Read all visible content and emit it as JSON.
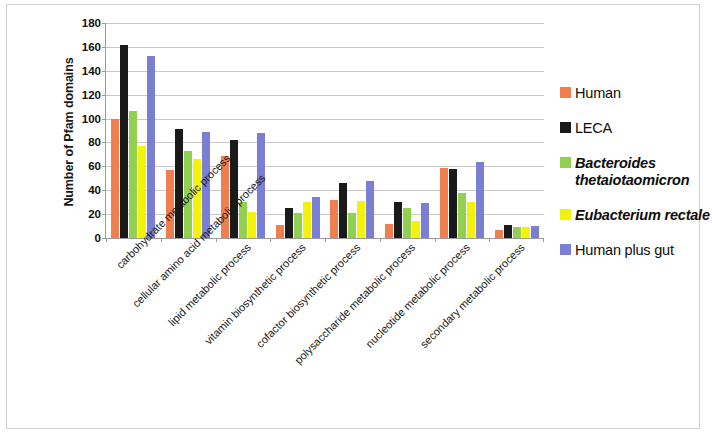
{
  "chart_data": {
    "type": "bar",
    "title": "",
    "subtitle": "",
    "xlabel": "",
    "ylabel": "Number of Pfam domains",
    "ylim": [
      0,
      180
    ],
    "ytick_step": 20,
    "yticks": [
      0,
      20,
      40,
      60,
      80,
      100,
      120,
      140,
      160,
      180
    ],
    "grid": true,
    "legend_position": "right",
    "categories": [
      "carbohydrate metabolic process",
      "cellular amino acid metabolic process",
      "lipid metabolic process",
      "vitamin biosynthetic process",
      "cofactor biosynthetic process",
      "polysaccharide metabolic process",
      "nucleotide metabolic process",
      "secondary metabolic process"
    ],
    "series": [
      {
        "name": "Human",
        "italic": false,
        "color": "#F07E4F",
        "values": [
          100,
          57,
          69,
          11,
          32,
          12,
          59,
          7
        ]
      },
      {
        "name": "LECA",
        "italic": false,
        "color": "#1A1A1A",
        "values": [
          162,
          91,
          82,
          25,
          46,
          30,
          58,
          11
        ]
      },
      {
        "name": "Bacteroides thetaiotaomicron",
        "italic": true,
        "color": "#92D14F",
        "values": [
          106,
          73,
          30,
          21,
          21,
          25,
          38,
          9
        ]
      },
      {
        "name": "Eubacterium rectale",
        "italic": true,
        "color": "#F2F20D",
        "values": [
          77,
          66,
          22,
          30,
          31,
          14,
          30,
          9
        ]
      },
      {
        "name": "Human plus gut",
        "italic": false,
        "color": "#7B7FD4",
        "values": [
          152,
          89,
          88,
          34,
          48,
          29,
          64,
          10
        ]
      }
    ]
  },
  "legend": {
    "items": [
      {
        "label": "Human",
        "color": "#F07E4F",
        "italic": false
      },
      {
        "label": "LECA",
        "color": "#1A1A1A",
        "italic": false
      },
      {
        "label": "Bacteroides thetaiotaomicron",
        "color": "#92D14F",
        "italic": true
      },
      {
        "label": "Eubacterium rectale",
        "color": "#F2F20D",
        "italic": true
      },
      {
        "label": "Human plus gut",
        "color": "#7B7FD4",
        "italic": false
      }
    ]
  }
}
